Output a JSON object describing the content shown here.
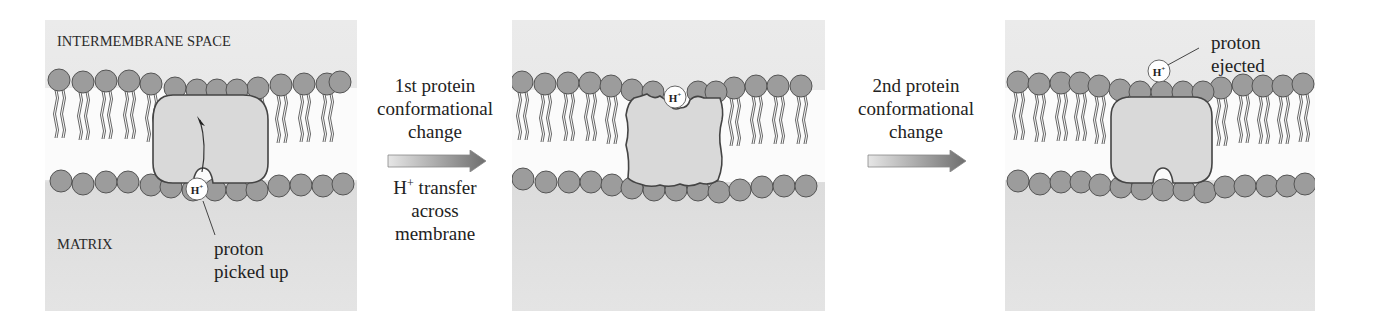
{
  "figure": {
    "panels": [
      {
        "id": "panel-1",
        "top_label": "INTERMEMBRANE SPACE",
        "bottom_label": "MATRIX",
        "callout": [
          "proton",
          "picked up"
        ],
        "proton_label": "H+"
      },
      {
        "id": "panel-2",
        "proton_label": "H+"
      },
      {
        "id": "panel-3",
        "callout": [
          "proton",
          "ejected"
        ],
        "proton_label": "H+"
      }
    ],
    "steps": [
      {
        "above": [
          "1st protein",
          "conformational",
          "change"
        ],
        "below_prefix": "H",
        "below_sup": "+",
        "below_rest": " transfer",
        "below": [
          "across",
          "membrane"
        ]
      },
      {
        "above": [
          "2nd protein",
          "conformational",
          "change"
        ]
      }
    ]
  },
  "colors": {
    "panel_bg": "#e8e8e8",
    "matrix_bg": "#dcdcdc",
    "lipid_head": "#9c9c9c",
    "lipid_outline": "#555555",
    "protein_fill": "#d9d9d9",
    "arrow_dark": "#707070",
    "arrow_light": "#e6e6e6"
  }
}
